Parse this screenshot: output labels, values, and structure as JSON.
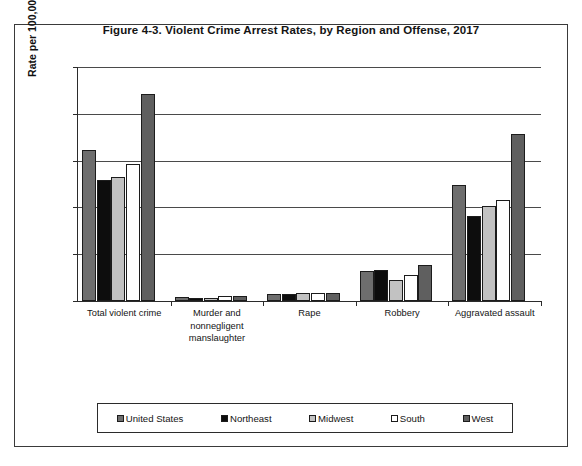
{
  "figure": {
    "title": "Figure 4-3. Violent Crime Arrest Rates, by Region and Offense, 2017"
  },
  "axes": {
    "y_title": "Rate per 100,000 inhabitants",
    "y_ticks": [
      "250",
      "200",
      "150",
      "100",
      "50",
      "0"
    ]
  },
  "legend": {
    "entries": [
      {
        "label": "United States",
        "color": "#6e6e6e"
      },
      {
        "label": "Northeast",
        "color": "#0d0d0d"
      },
      {
        "label": "Midwest",
        "color": "#c2c2c2"
      },
      {
        "label": "South",
        "color": "#ffffff"
      },
      {
        "label": "West",
        "color": "#5f5f5f"
      }
    ]
  },
  "chart_data": {
    "type": "bar",
    "title": "Figure 4-3. Violent Crime Arrest Rates, by Region and Offense, 2017",
    "xlabel": "",
    "ylabel": "Rate per 100,000 inhabitants",
    "ylim": [
      0,
      250
    ],
    "ytick_step": 50,
    "grid": true,
    "legend_position": "bottom",
    "categories": [
      "Total violent crime",
      "Murder and nonnegligent manslaughter",
      "Rape",
      "Robbery",
      "Aggravated assault"
    ],
    "category_label_lines": [
      [
        "Total violent crime"
      ],
      [
        "Murder and",
        "nonnegligent",
        "manslaughter"
      ],
      [
        "Rape"
      ],
      [
        "Robbery"
      ],
      [
        "Aggravated assault"
      ]
    ],
    "series": [
      {
        "name": "United States",
        "color": "#6e6e6e",
        "values": [
          161,
          4,
          8,
          32,
          124
        ]
      },
      {
        "name": "Northeast",
        "color": "#0d0d0d",
        "values": [
          129,
          3,
          8,
          33,
          91
        ]
      },
      {
        "name": "Midwest",
        "color": "#c2c2c2",
        "values": [
          132,
          3,
          9,
          22,
          101
        ]
      },
      {
        "name": "South",
        "color": "#ffffff",
        "values": [
          146,
          5,
          9,
          28,
          108
        ]
      },
      {
        "name": "West",
        "color": "#5f5f5f",
        "values": [
          221,
          5,
          9,
          38,
          178
        ]
      }
    ]
  }
}
